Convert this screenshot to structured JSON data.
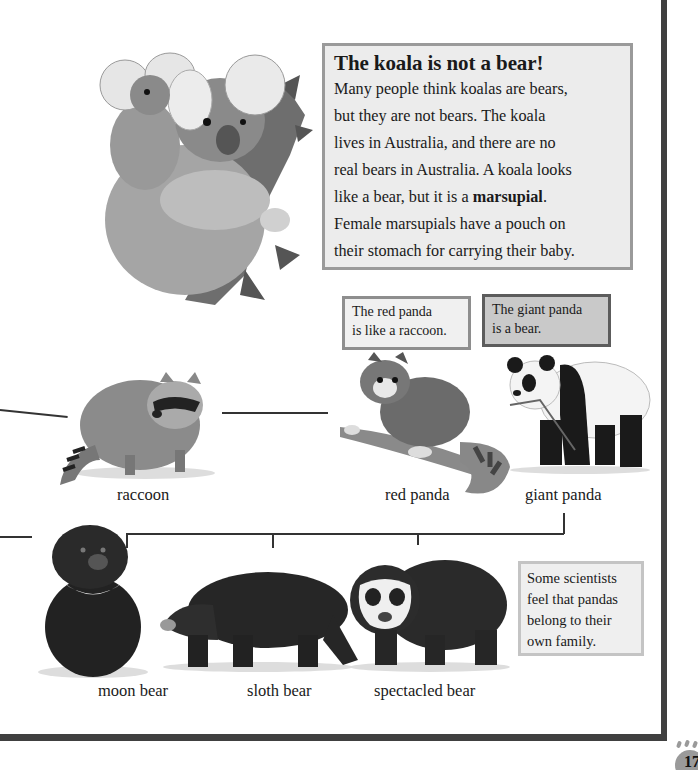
{
  "info_box": {
    "title": "The koala is not a bear!",
    "body_lines": [
      "Many people think koalas are bears,",
      "but they are not bears. The koala",
      "lives in Australia, and there are no",
      "real bears in Australia. A koala looks"
    ],
    "line5_pre": "like a bear, but it is a ",
    "line5_bold": "marsupial",
    "line5_post": ".",
    "line6": "Female marsupials have a pouch on",
    "line7": "their stomach for carrying their baby."
  },
  "captions": {
    "red_panda": [
      "The red panda",
      "is like a raccoon."
    ],
    "giant_panda": [
      "The giant panda",
      "is a bear."
    ],
    "scientists": [
      "Some scientists",
      "feel that pandas",
      "belong to their",
      "own family."
    ]
  },
  "animals": {
    "koala": "koala",
    "raccoon": "raccoon",
    "red_panda": "red panda",
    "giant_panda": "giant panda",
    "moon_bear": "moon bear",
    "sloth_bear": "sloth bear",
    "spectacled_bear": "spectacled bear"
  },
  "page": {
    "number": "17"
  },
  "colors": {
    "frame": "#404040",
    "info_bg": "#ececec",
    "info_border": "#9a9a9a",
    "giant_bg": "#c9c9c9",
    "giant_border": "#5c5c5c"
  }
}
